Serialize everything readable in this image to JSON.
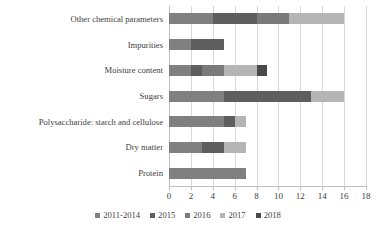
{
  "chart_data": {
    "type": "bar",
    "orientation": "horizontal",
    "stacked": true,
    "title": "",
    "subtitle": "",
    "xlabel": "",
    "ylabel": "",
    "xlim": [
      0,
      18
    ],
    "xticks": [
      0,
      2,
      4,
      6,
      8,
      10,
      12,
      14,
      16,
      18
    ],
    "xtick_labels": [
      "0",
      "2",
      "4",
      "6",
      "8",
      "10",
      "12",
      "14",
      "16",
      "18"
    ],
    "grid": true,
    "grid_axis": "x",
    "legend_position": "bottom",
    "categories": [
      "Other chemical parameters",
      "Impurities",
      "Moisture content",
      "Sugars",
      "Polysaccharide: starch and cellulose",
      "Dry matter",
      "Protein"
    ],
    "series": [
      {
        "name": "2011-2014",
        "color": "#808080",
        "values": [
          4,
          2,
          2,
          5,
          5,
          3,
          7
        ]
      },
      {
        "name": "2015",
        "color": "#5e5e5e",
        "values": [
          4,
          3,
          1,
          8,
          1,
          2,
          0
        ]
      },
      {
        "name": "2016",
        "color": "#7a7a7a",
        "values": [
          3,
          0,
          2,
          0,
          0,
          0,
          0
        ]
      },
      {
        "name": "2017",
        "color": "#b5b5b5",
        "values": [
          5,
          0,
          3,
          3,
          1,
          2,
          0
        ]
      },
      {
        "name": "2018",
        "color": "#4a4a4a",
        "values": [
          0,
          0,
          1,
          0,
          0,
          0,
          0
        ]
      }
    ],
    "totals": [
      16,
      5,
      9,
      16,
      7,
      7,
      7
    ]
  },
  "legend": {
    "items": [
      {
        "label": "2011-2014",
        "color": "#808080"
      },
      {
        "label": "2015",
        "color": "#5e5e5e"
      },
      {
        "label": "2016",
        "color": "#7a7a7a"
      },
      {
        "label": "2017",
        "color": "#b5b5b5"
      },
      {
        "label": "2018",
        "color": "#4a4a4a"
      }
    ]
  },
  "colors": {
    "background": "#ffffff",
    "gridline": "#d9d9d9",
    "axis": "#bfbfbf",
    "text": "#404040"
  }
}
